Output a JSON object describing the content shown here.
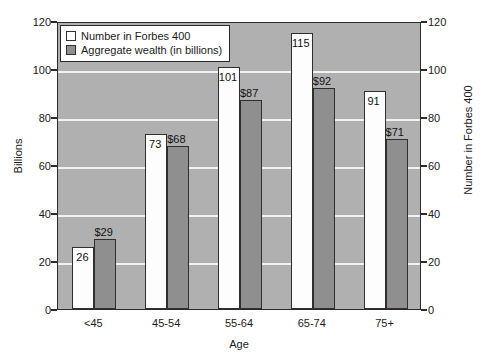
{
  "chart_data": {
    "type": "bar",
    "title": "",
    "subtitle": "",
    "xlabel": "Age",
    "ylabel": "Billions",
    "ylabel_right": "Number in Forbes 400",
    "categories": [
      "<45",
      "45-54",
      "55-64",
      "65-74",
      "75+"
    ],
    "series": [
      {
        "name": "Number in Forbes 400",
        "color": "#ffffff",
        "values": [
          26,
          73,
          101,
          115,
          91
        ],
        "labels": [
          "26",
          "73",
          "101",
          "115",
          "91"
        ]
      },
      {
        "name": "Aggregate wealth (in billions)",
        "color": "#8f8f8f",
        "values": [
          29,
          68,
          87,
          92,
          71
        ],
        "labels": [
          "$29",
          "$68",
          "$87",
          "$92",
          "$71"
        ]
      }
    ],
    "ylim": [
      0,
      120
    ],
    "ylim_right": [
      0,
      120
    ],
    "yticks": [
      0,
      20,
      40,
      60,
      80,
      100,
      120
    ],
    "ytick_labels": [
      "0",
      "20",
      "40",
      "60",
      "80",
      "100",
      "120"
    ],
    "yticks_right": [
      0,
      20,
      40,
      60,
      80,
      100,
      120
    ],
    "ytick_labels_right": [
      "0",
      "20",
      "40",
      "60",
      "80",
      "100",
      "120"
    ],
    "grid": true,
    "grid_color": "#f2f2f2",
    "plot_background": "#b0b0b0",
    "legend_position": "top-left",
    "legend": [
      {
        "label": "Number in Forbes 400",
        "swatch": "white"
      },
      {
        "label": "Aggregate wealth (in billions)",
        "swatch": "gray"
      }
    ]
  }
}
